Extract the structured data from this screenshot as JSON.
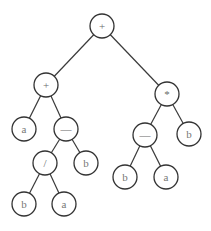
{
  "diagram": {
    "title": "",
    "type": "expression-tree",
    "colors": {
      "edge": "#3a3a3a",
      "node_stroke": "#333333",
      "label": "#777777",
      "background": "#ffffff"
    },
    "node_radius": 12,
    "nodes": [
      {
        "id": "n0",
        "label": "+",
        "x": 102,
        "y": 26
      },
      {
        "id": "n1",
        "label": "+",
        "x": 46,
        "y": 85
      },
      {
        "id": "n2",
        "label": "*",
        "x": 167,
        "y": 94
      },
      {
        "id": "n3",
        "label": "a",
        "x": 24,
        "y": 129
      },
      {
        "id": "n4",
        "label": "—",
        "x": 66,
        "y": 129
      },
      {
        "id": "n5",
        "label": "/",
        "x": 45,
        "y": 163
      },
      {
        "id": "n6",
        "label": "b",
        "x": 86,
        "y": 163
      },
      {
        "id": "n7",
        "label": "b",
        "x": 24,
        "y": 204
      },
      {
        "id": "n8",
        "label": "a",
        "x": 64,
        "y": 204
      },
      {
        "id": "n9",
        "label": "—",
        "x": 145,
        "y": 135
      },
      {
        "id": "n10",
        "label": "b",
        "x": 189,
        "y": 134
      },
      {
        "id": "n11",
        "label": "b",
        "x": 125,
        "y": 177
      },
      {
        "id": "n12",
        "label": "a",
        "x": 166,
        "y": 177
      }
    ],
    "edges": [
      [
        "n0",
        "n1"
      ],
      [
        "n0",
        "n2"
      ],
      [
        "n1",
        "n3"
      ],
      [
        "n1",
        "n4"
      ],
      [
        "n4",
        "n5"
      ],
      [
        "n4",
        "n6"
      ],
      [
        "n5",
        "n7"
      ],
      [
        "n5",
        "n8"
      ],
      [
        "n2",
        "n9"
      ],
      [
        "n2",
        "n10"
      ],
      [
        "n9",
        "n11"
      ],
      [
        "n9",
        "n12"
      ]
    ]
  }
}
